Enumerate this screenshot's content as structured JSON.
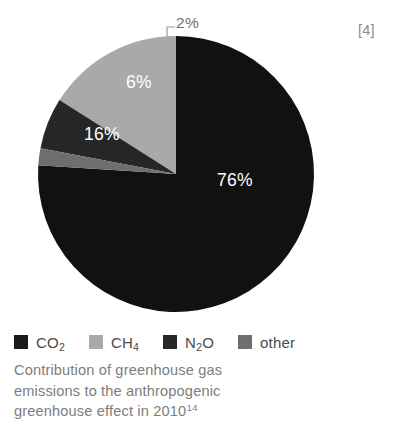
{
  "figure": {
    "source_marker": "[4]",
    "caption_lines": [
      "Contribution of greenhouse gas",
      "emissions to the anthropogenic",
      "greenhouse effect in 2010"
    ],
    "caption_footnote": "14"
  },
  "callout": {
    "label": "2%"
  },
  "legend": {
    "items": [
      {
        "label_main": "CO",
        "label_sub": "2",
        "label_tail": "",
        "color": "#1a1a1a",
        "swatch_name": "legend-swatch-co2"
      },
      {
        "label_main": "CH",
        "label_sub": "4",
        "label_tail": "",
        "color": "#a9a9a9",
        "swatch_name": "legend-swatch-ch4"
      },
      {
        "label_main": "N",
        "label_sub": "2",
        "label_tail": "O",
        "color": "#262626",
        "swatch_name": "legend-swatch-n2o"
      },
      {
        "label_main": "other",
        "label_sub": "",
        "label_tail": "",
        "color": "#6e6e6e",
        "swatch_name": "legend-swatch-other"
      }
    ]
  },
  "chart_data": {
    "type": "pie",
    "unit": "%",
    "start_angle_deg": 0,
    "direction": "clockwise",
    "total": 100,
    "legend_position": "bottom",
    "labels_inside": true,
    "categories": [
      "CO2",
      "CH4",
      "N2O",
      "other"
    ],
    "values": [
      76,
      16,
      6,
      2
    ],
    "colors": [
      "#111111",
      "#a9a9a9",
      "#262626",
      "#6e6e6e"
    ],
    "slices": [
      {
        "name": "CO2",
        "display_name": "CO₂",
        "value": 76,
        "data_label": "76%",
        "color": "#111111",
        "label_x": 235,
        "label_y": 180,
        "path": "M 139 0 A 139 139 0 1 1 138.4 0 Z"
      },
      {
        "name": "CH4",
        "display_name": "CH₄",
        "value": 16,
        "data_label": "16%",
        "color": "#a9a9a9",
        "label_x": 102,
        "label_y": 134
      },
      {
        "name": "N2O",
        "display_name": "N₂O",
        "value": 6,
        "data_label": "6%",
        "color": "#262626",
        "label_x": 139,
        "label_y": 82
      },
      {
        "name": "other",
        "display_name": "other",
        "value": 2,
        "data_label": "2%",
        "color": "#6e6e6e",
        "label_x": 189,
        "label_y": 22,
        "label_is_callout": true
      }
    ]
  }
}
